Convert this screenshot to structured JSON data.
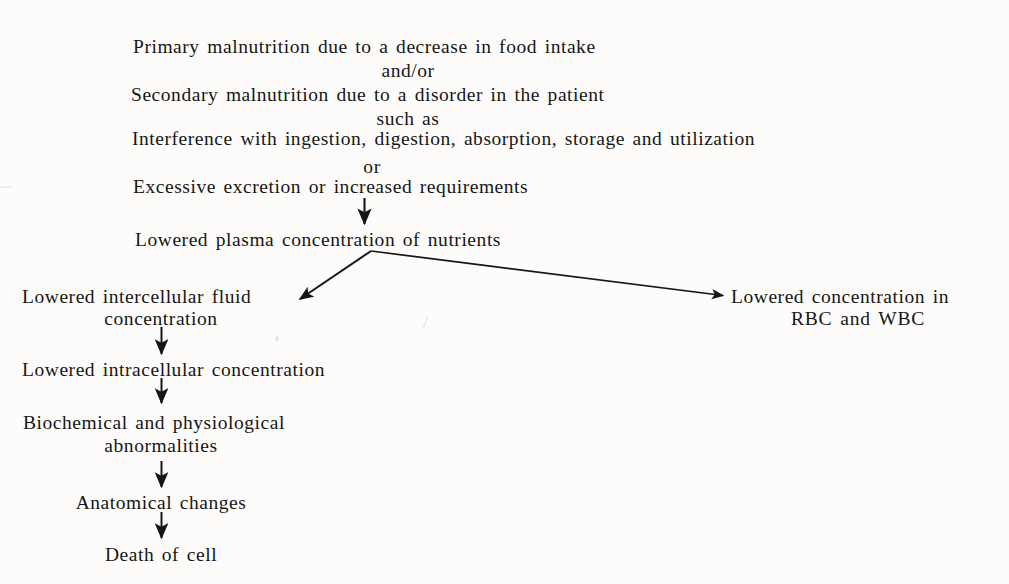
{
  "diagram": {
    "ink_color": "#161616",
    "background_color": "#fdfcfb",
    "nodes": [
      {
        "id": "primary",
        "text": "Primary malnutrition due to a decrease in food intake"
      },
      {
        "id": "andor",
        "text": "and/or"
      },
      {
        "id": "secondary",
        "text": "Secondary malnutrition due to a disorder in the patient"
      },
      {
        "id": "suchas",
        "text": "such as"
      },
      {
        "id": "interference",
        "text": "Interference  with  ingestion,  digestion,  absorption,  storage  and  utilization"
      },
      {
        "id": "or",
        "text": "or"
      },
      {
        "id": "excessive",
        "text": "Excessive excretion or increased requirements"
      },
      {
        "id": "plasma",
        "text": "Lowered  plasma  concentration  of  nutrients"
      },
      {
        "id": "intercell1",
        "text": "Lowered  intercellular  fluid"
      },
      {
        "id": "intercell2",
        "text": "concentration"
      },
      {
        "id": "rbcwbc1",
        "text": "Lowered  concentration  in"
      },
      {
        "id": "rbcwbc2",
        "text": "RBC and WBC"
      },
      {
        "id": "intracell",
        "text": "Lowered  intracellular  concentration"
      },
      {
        "id": "biochem1",
        "text": "Biochemical  and  physiological"
      },
      {
        "id": "biochem2",
        "text": "abnormalities"
      },
      {
        "id": "anatomical",
        "text": "Anatomical  changes"
      },
      {
        "id": "death",
        "text": "Death of cell"
      }
    ],
    "arrows": [
      {
        "id": "arrow-excessive-to-plasma",
        "kind": "vertical"
      },
      {
        "id": "arrow-plasma-to-intercellular",
        "kind": "diagonal-left"
      },
      {
        "id": "arrow-plasma-to-rbc-wbc",
        "kind": "diagonal-right"
      },
      {
        "id": "arrow-intercellular-to-intracellular",
        "kind": "vertical"
      },
      {
        "id": "arrow-intracellular-to-biochemical",
        "kind": "vertical"
      },
      {
        "id": "arrow-biochemical-to-anatomical",
        "kind": "vertical"
      },
      {
        "id": "arrow-anatomical-to-death",
        "kind": "vertical"
      }
    ]
  }
}
